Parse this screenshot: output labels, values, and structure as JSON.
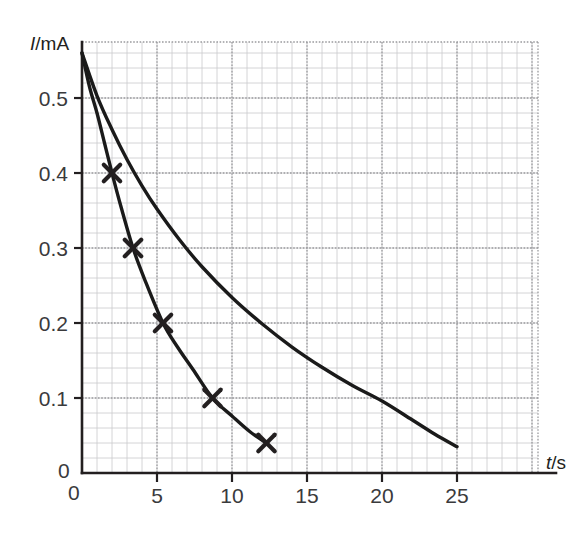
{
  "figure": {
    "kind": "line-graph",
    "background_color": "#ffffff",
    "ink_color": "#231f20",
    "grid_major_color": "#9b9b9e",
    "grid_minor_color": "#c9c9cc"
  },
  "chart_data": {
    "type": "line",
    "title": "",
    "subtitle": "",
    "xlabel": "t/s",
    "ylabel": "I/mA",
    "xlabel_parts": {
      "symbol": "t",
      "unit": "/s"
    },
    "ylabel_parts": {
      "symbol": "I",
      "unit": "/mA"
    },
    "xlim": [
      0,
      30.4
    ],
    "ylim": [
      0,
      0.5747
    ],
    "x_ticks": [
      0,
      5,
      10,
      15,
      20,
      25
    ],
    "x_tick_labels": [
      "0",
      "5",
      "10",
      "15",
      "20",
      "25"
    ],
    "y_ticks": [
      0,
      0.1,
      0.2,
      0.3,
      0.4,
      0.5
    ],
    "y_tick_labels": [
      "0",
      "0.1",
      "0.2",
      "0.3",
      "0.4",
      "0.5"
    ],
    "origin_label_y": "0",
    "origin_label_x": "0",
    "grid": true,
    "grid_major_x_step": 5,
    "grid_major_y_step": 0.1,
    "grid_minor_x_step": 1,
    "grid_minor_y_step": 0.02,
    "legend": false,
    "legend_position": "none",
    "annotations": [],
    "series": [
      {
        "name": "fast-decay-curve",
        "style": "solid",
        "color": "#1a1a1a",
        "markers": "x",
        "marker_points": [
          {
            "x": 2.0,
            "y": 0.4
          },
          {
            "x": 3.4,
            "y": 0.3
          },
          {
            "x": 5.4,
            "y": 0.2
          },
          {
            "x": 8.7,
            "y": 0.1
          },
          {
            "x": 12.3,
            "y": 0.04
          }
        ],
        "x": [
          0,
          0.5,
          1,
          1.5,
          2,
          2.6,
          3.4,
          4.2,
          5.4,
          6.4,
          7.4,
          8.7,
          10,
          11.2,
          12.3
        ],
        "y": [
          0.56,
          0.515,
          0.48,
          0.44,
          0.4,
          0.355,
          0.3,
          0.257,
          0.2,
          0.167,
          0.138,
          0.1,
          0.076,
          0.055,
          0.04
        ]
      },
      {
        "name": "slow-decay-curve",
        "style": "solid",
        "color": "#1a1a1a",
        "markers": "none",
        "marker_points": [],
        "x": [
          0,
          1,
          2,
          3,
          4,
          5,
          6.5,
          8,
          10,
          12,
          14,
          16,
          18,
          20,
          22,
          23.5,
          25
        ],
        "y": [
          0.56,
          0.503,
          0.458,
          0.418,
          0.383,
          0.352,
          0.311,
          0.275,
          0.234,
          0.199,
          0.168,
          0.141,
          0.117,
          0.096,
          0.071,
          0.052,
          0.035
        ]
      }
    ]
  },
  "geometry": {
    "plot_left_px": 82,
    "plot_right_px": 538,
    "plot_top_px": 42,
    "plot_bottom_px": 473,
    "axis_arrow_end_px": 556
  }
}
